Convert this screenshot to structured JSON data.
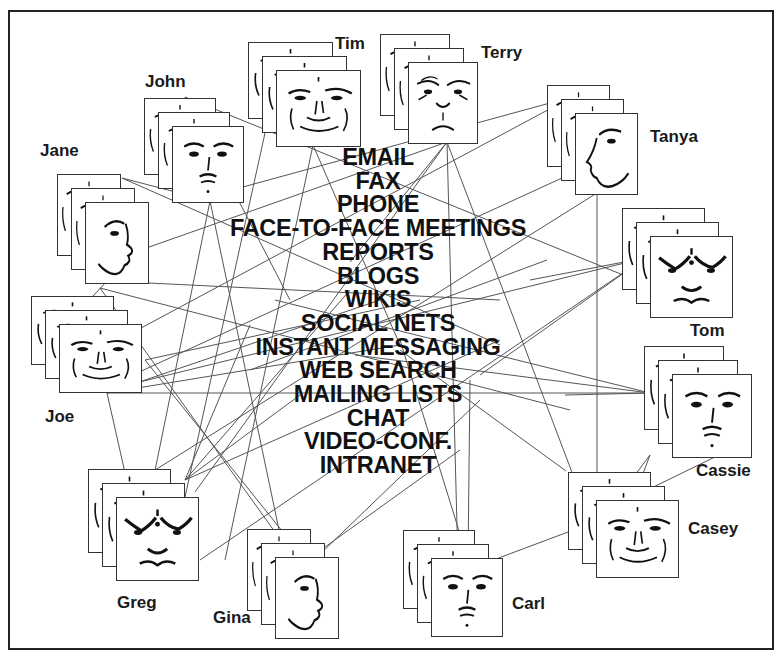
{
  "diagram": {
    "type": "social-network-illustration",
    "line_color": "#555555",
    "text_color": "#111111",
    "border_color": "#222222"
  },
  "media_channels": [
    "EMAIL",
    "FAX",
    "PHONE",
    "FACE-TO-FACE MEETINGS",
    "REPORTS",
    "BLOGS",
    "WIKIS",
    "SOCIAL NETS",
    "INSTANT MESSAGING",
    "WEB SEARCH",
    "MAILING LISTS",
    "CHAT",
    "VIDEO-CONF.",
    "INTRANET"
  ],
  "people": [
    {
      "name": "Tim",
      "face": "frontal-wrinkled",
      "front": [
        276,
        70,
        85,
        75
      ],
      "label": [
        335,
        35
      ]
    },
    {
      "name": "Terry",
      "face": "frontal-frown",
      "front": [
        408,
        62,
        70,
        80
      ],
      "label": [
        481,
        44
      ]
    },
    {
      "name": "John",
      "face": "frontal-plain",
      "front": [
        172,
        126,
        72,
        75
      ],
      "label": [
        145,
        73
      ]
    },
    {
      "name": "Jane",
      "face": "profile-right",
      "front": [
        85,
        202,
        64,
        80
      ],
      "label": [
        40,
        142
      ]
    },
    {
      "name": "Tanya",
      "face": "profile-left",
      "front": [
        575,
        113,
        63,
        80
      ],
      "label": [
        650,
        128
      ]
    },
    {
      "name": "Tom",
      "face": "frontal-stylized",
      "front": [
        650,
        236,
        83,
        80
      ],
      "label": [
        690,
        322
      ]
    },
    {
      "name": "Joe",
      "face": "frontal-wrinkled",
      "front": [
        59,
        324,
        83,
        67
      ],
      "label": [
        45,
        408
      ]
    },
    {
      "name": "Cassie",
      "face": "frontal-plain",
      "front": [
        672,
        374,
        80,
        82
      ],
      "label": [
        696,
        462
      ]
    },
    {
      "name": "Greg",
      "face": "frontal-stylized",
      "front": [
        116,
        497,
        83,
        82
      ],
      "label": [
        117,
        594
      ]
    },
    {
      "name": "Gina",
      "face": "profile-right",
      "front": [
        275,
        557,
        64,
        80
      ],
      "label": [
        213,
        609
      ]
    },
    {
      "name": "Carl",
      "face": "frontal-plain",
      "front": [
        431,
        558,
        72,
        77
      ],
      "label": [
        512,
        595
      ]
    },
    {
      "name": "Casey",
      "face": "frontal-wrinkled",
      "front": [
        596,
        500,
        83,
        76
      ],
      "label": [
        688,
        520
      ]
    }
  ],
  "links": [
    [
      185,
      97,
      660,
      290
    ],
    [
      185,
      97,
      290,
      300
    ],
    [
      210,
      201,
      300,
      630
    ],
    [
      210,
      201,
      150,
      495
    ],
    [
      122,
      178,
      210,
      201
    ],
    [
      122,
      178,
      500,
      345
    ],
    [
      313,
      145,
      400,
      345
    ],
    [
      313,
      145,
      225,
      560
    ],
    [
      265,
      133,
      185,
      497
    ],
    [
      447,
      142,
      350,
      262
    ],
    [
      447,
      142,
      458,
      565
    ],
    [
      447,
      142,
      590,
      520
    ],
    [
      447,
      142,
      195,
      492
    ],
    [
      447,
      142,
      135,
      252
    ],
    [
      572,
      97,
      210,
      196
    ],
    [
      572,
      97,
      100,
      350
    ],
    [
      562,
      178,
      100,
      390
    ],
    [
      597,
      193,
      597,
      520
    ],
    [
      597,
      193,
      120,
      492
    ],
    [
      547,
      260,
      250,
      370
    ],
    [
      645,
      258,
      107,
      390
    ],
    [
      645,
      258,
      530,
      280
    ],
    [
      645,
      258,
      480,
      375
    ],
    [
      645,
      258,
      200,
      560
    ],
    [
      650,
      393,
      107,
      393
    ],
    [
      650,
      393,
      275,
      300
    ],
    [
      650,
      393,
      355,
      355
    ],
    [
      650,
      393,
      565,
      395
    ],
    [
      107,
      393,
      130,
      495
    ],
    [
      107,
      393,
      380,
      300
    ],
    [
      107,
      393,
      400,
      345
    ],
    [
      100,
      288,
      570,
      410
    ],
    [
      100,
      288,
      295,
      560
    ],
    [
      107,
      281,
      80,
      310
    ],
    [
      107,
      281,
      500,
      300
    ],
    [
      145,
      360,
      303,
      557
    ],
    [
      145,
      360,
      420,
      300
    ],
    [
      185,
      480,
      300,
      395
    ],
    [
      185,
      480,
      250,
      325
    ],
    [
      185,
      480,
      350,
      290
    ],
    [
      185,
      480,
      500,
      340
    ],
    [
      650,
      455,
      635,
      495
    ],
    [
      650,
      455,
      620,
      495
    ],
    [
      717,
      456,
      635,
      496
    ],
    [
      566,
      471,
      400,
      350
    ],
    [
      480,
      565,
      600,
      520
    ],
    [
      468,
      560,
      400,
      340
    ],
    [
      468,
      560,
      470,
      380
    ],
    [
      317,
      557,
      480,
      400
    ],
    [
      300,
      565,
      460,
      450
    ]
  ]
}
